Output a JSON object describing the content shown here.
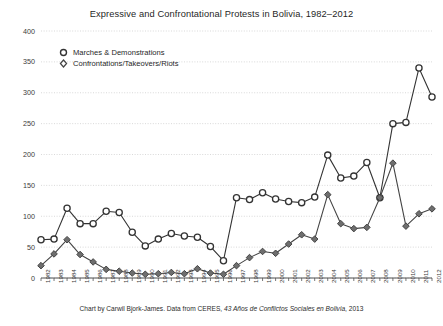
{
  "chart_data": {
    "type": "line",
    "title": "Expressive and Confrontational Protests in Bolivia, 1982–2012",
    "xlabel": "",
    "ylabel": "",
    "ylim": [
      0,
      400
    ],
    "ytick_step": 50,
    "yticks": [
      0,
      50,
      100,
      150,
      200,
      250,
      300,
      350,
      400
    ],
    "grid": true,
    "grid_style": "dotted-horizontal",
    "legend_position": "upper-left-inside",
    "categories": [
      "1982",
      "1983",
      "1984",
      "1985",
      "1986",
      "1987",
      "1988",
      "1989",
      "1990",
      "1991",
      "1992",
      "1993",
      "1994",
      "1995",
      "1996",
      "1997",
      "1998",
      "1999",
      "2000",
      "2001",
      "2002",
      "2003",
      "2004",
      "2005",
      "2006",
      "2007",
      "2008",
      "2009",
      "2010",
      "2011",
      "2012"
    ],
    "series": [
      {
        "name": "Marches & Demonstrations",
        "marker": "circle",
        "color": "#333333",
        "values": [
          62,
          63,
          113,
          88,
          88,
          108,
          106,
          74,
          52,
          63,
          72,
          68,
          66,
          51,
          28,
          130,
          127,
          138,
          128,
          124,
          122,
          131,
          199,
          162,
          165,
          187,
          130,
          250,
          252,
          340,
          293
        ]
      },
      {
        "name": "Confrontations/Takeovers/Riots",
        "marker": "diamond",
        "color": "#444444",
        "values": [
          20,
          39,
          62,
          38,
          26,
          14,
          11,
          8,
          6,
          7,
          9,
          7,
          15,
          8,
          6,
          20,
          33,
          43,
          40,
          55,
          70,
          63,
          135,
          88,
          80,
          82,
          130,
          186,
          84,
          104,
          112
        ]
      }
    ],
    "annotations": []
  },
  "legend": {
    "items": [
      {
        "label": "Marches & Demonstrations",
        "marker": "circle-marker-icon"
      },
      {
        "label": "Confrontations/Takeovers/Riots",
        "marker": "diamond-marker-icon"
      }
    ]
  },
  "caption": {
    "prefix": "Chart by Carwil Bjork-James. Data from CERES, ",
    "italic": "43 Años de Conflictos Sociales en Bolivia",
    "suffix": ", 2013"
  },
  "colors": {
    "marches": "#333333",
    "confrontations": "#444444",
    "grid": "#cfcfcf",
    "axis": "#555555",
    "text": "#2b2b2b",
    "background": "#ffffff"
  }
}
